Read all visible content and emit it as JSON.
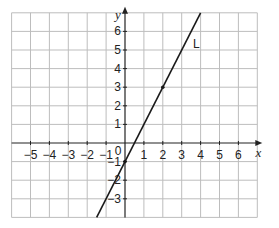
{
  "chart_data": {
    "type": "line",
    "title": "",
    "xlabel": "x",
    "ylabel": "y",
    "xlim": [
      -6,
      7
    ],
    "ylim": [
      -4,
      7
    ],
    "grid": true,
    "x_tick_labels": [
      "−5",
      "−4",
      "−3",
      "−2",
      "−1",
      "1",
      "2",
      "3",
      "4",
      "5",
      "6"
    ],
    "x_ticks": [
      -5,
      -4,
      -3,
      -2,
      -1,
      1,
      2,
      3,
      4,
      5,
      6
    ],
    "y_tick_labels": [
      "6",
      "5",
      "4",
      "3",
      "2",
      "1",
      "−1",
      "−2",
      "−3"
    ],
    "y_ticks": [
      6,
      5,
      4,
      3,
      2,
      1,
      -1,
      -2,
      -3
    ],
    "origin_label": "0",
    "series": [
      {
        "name": "L",
        "equation": "y = 2x - 1",
        "slope": 2,
        "intercept": -1,
        "x": [
          -1.5,
          4
        ],
        "y": [
          -4,
          7
        ],
        "marked_points": [
          [
            0,
            -1
          ],
          [
            2,
            3
          ]
        ]
      }
    ],
    "annotations": [
      {
        "text": "L",
        "x": 3.6,
        "y": 5.3
      }
    ]
  },
  "colors": {
    "grid": "#bdbdbd",
    "axis": "#222222",
    "line": "#1a1a1a"
  }
}
